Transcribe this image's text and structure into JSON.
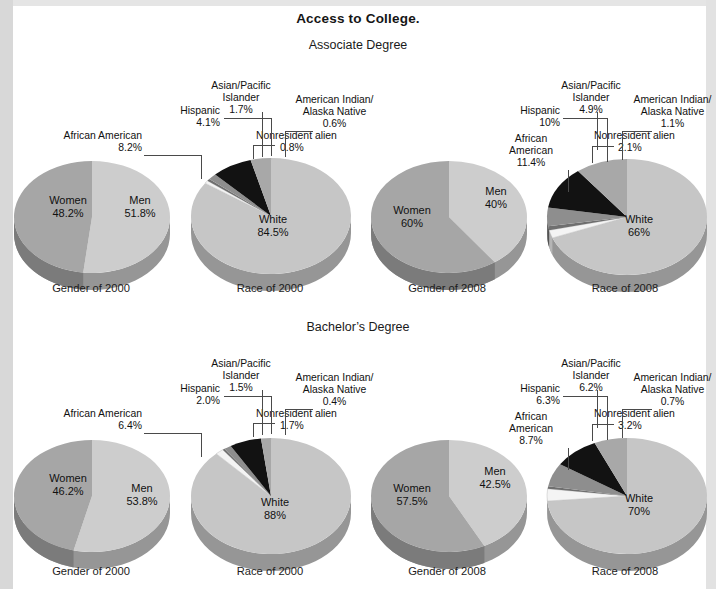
{
  "title": "Access to College.",
  "sections": [
    {
      "id": "associate",
      "label": "Associate Degree"
    },
    {
      "id": "bachelors",
      "label": "Bachelor’s Degree"
    }
  ],
  "captions": {
    "gender_2000": "Gender of 2000",
    "race_2000": "Race of 2000",
    "gender_2008": "Gender of 2008",
    "race_2008": "Race of 2008"
  },
  "labels": {
    "women": "Women",
    "men": "Men",
    "white": "White",
    "african_american": "African American",
    "african_american_2line_a": "African",
    "african_american_2line_b": "American",
    "hispanic": "Hispanic",
    "asian_a": "Asian/Pacific",
    "asian_b": "Islander",
    "amind_a": "American Indian/",
    "amind_b": "Alaska Native",
    "nonresident": "Nonresident alien"
  },
  "colors": {
    "white_slice": "#c6c6c6",
    "white_slice_side": "#9a9a9a",
    "hispanic_slice": "#a8a8a8",
    "african_american_slice": "#121212",
    "asian_slice": "#8e8e8e",
    "amind_slice": "#6f6f6f",
    "nonresident_slice": "#f4f4f4",
    "women_slice": "#a6a6a6",
    "men_slice": "#cdcdcd",
    "page_background": "#ffffff",
    "text": "#111111"
  },
  "chart_data": [
    {
      "type": "pie",
      "title": "Gender of 2000",
      "section": "Associate Degree",
      "categories": [
        "Men",
        "Women"
      ],
      "values": [
        51.8,
        48.2
      ],
      "value_labels": [
        "51.8%",
        "40.2%"
      ],
      "display_labels": [
        "51.8%",
        "48.2%"
      ],
      "unit": "percent",
      "legend": "in-slice"
    },
    {
      "type": "pie",
      "title": "Race of 2000",
      "section": "Associate Degree",
      "categories": [
        "White",
        "Nonresident alien",
        "American Indian/Alaska Native",
        "Asian/Pacific Islander",
        "African American",
        "Hispanic"
      ],
      "values": [
        84.5,
        0.8,
        0.6,
        1.7,
        8.2,
        4.1
      ],
      "display_labels": [
        "84.5%",
        "0.8%",
        "0.6%",
        "1.7%",
        "8.2%",
        "4.1%"
      ],
      "unit": "percent",
      "legend": "callout"
    },
    {
      "type": "pie",
      "title": "Gender of 2008",
      "section": "Associate Degree",
      "categories": [
        "Men",
        "Women"
      ],
      "values": [
        40,
        60
      ],
      "display_labels": [
        "40%",
        "60%"
      ],
      "unit": "percent",
      "legend": "in-slice"
    },
    {
      "type": "pie",
      "title": "Race of 2008",
      "section": "Associate Degree",
      "categories": [
        "White",
        "Nonresident alien",
        "American Indian/Alaska Native",
        "Asian/Pacific Islander",
        "African American",
        "Hispanic"
      ],
      "values": [
        66,
        2.1,
        1.1,
        4.9,
        11.4,
        10
      ],
      "display_labels": [
        "66%",
        "2.1%",
        "1.1%",
        "4.9%",
        "11.4%",
        "10%"
      ],
      "unit": "percent",
      "legend": "callout"
    },
    {
      "type": "pie",
      "title": "Gender of 2000",
      "section": "Bachelor’s Degree",
      "categories": [
        "Men",
        "Women"
      ],
      "values": [
        53.8,
        46.2
      ],
      "display_labels": [
        "53.8%",
        "46.2%"
      ],
      "unit": "percent",
      "legend": "in-slice"
    },
    {
      "type": "pie",
      "title": "Race of 2000",
      "section": "Bachelor’s Degree",
      "categories": [
        "White",
        "Nonresident alien",
        "American Indian/Alaska Native",
        "Asian/Pacific Islander",
        "African American",
        "Hispanic"
      ],
      "values": [
        88,
        1.7,
        0.4,
        1.5,
        6.4,
        2.0
      ],
      "display_labels": [
        "88%",
        "1.7%",
        "0.4%",
        "1.5%",
        "6.4%",
        "2.0%"
      ],
      "unit": "percent",
      "legend": "callout"
    },
    {
      "type": "pie",
      "title": "Gender of 2008",
      "section": "Bachelor’s Degree",
      "categories": [
        "Men",
        "Women"
      ],
      "values": [
        42.5,
        57.5
      ],
      "display_labels": [
        "42.5%",
        "57.5%"
      ],
      "unit": "percent",
      "legend": "in-slice"
    },
    {
      "type": "pie",
      "title": "Race of 2008",
      "section": "Bachelor’s Degree",
      "categories": [
        "White",
        "Nonresident alien",
        "American Indian/Alaska Native",
        "Asian/Pacific Islander",
        "African American",
        "Hispanic"
      ],
      "values": [
        70,
        3.2,
        0.7,
        6.2,
        8.7,
        6.3
      ],
      "display_labels": [
        "70%",
        "3.2%",
        "0.7%",
        "6.2%",
        "8.7%",
        "6.3%"
      ],
      "unit": "percent",
      "legend": "callout"
    }
  ],
  "pies": {
    "a_gender2000": {
      "men": "51.8%",
      "women": "48.2%"
    },
    "a_race2000": {
      "white": "84.5%",
      "nonres": "0.8%",
      "amind": "0.6%",
      "asian": "1.7%",
      "afram": "8.2%",
      "hisp": "4.1%"
    },
    "a_gender2008": {
      "men": "40%",
      "women": "60%"
    },
    "a_race2008": {
      "white": "66%",
      "nonres": "2.1%",
      "amind": "1.1%",
      "asian": "4.9%",
      "afram": "11.4%",
      "hisp": "10%"
    },
    "b_gender2000": {
      "men": "53.8%",
      "women": "46.2%"
    },
    "b_race2000": {
      "white": "88%",
      "nonres": "1.7%",
      "amind": "0.4%",
      "asian": "1.5%",
      "afram": "6.4%",
      "hisp": "2.0%"
    },
    "b_gender2008": {
      "men": "42.5%",
      "women": "57.5%"
    },
    "b_race2008": {
      "white": "70%",
      "nonres": "3.2%",
      "amind": "0.7%",
      "asian": "6.2%",
      "afram": "8.7%",
      "hisp": "6.3%"
    }
  }
}
